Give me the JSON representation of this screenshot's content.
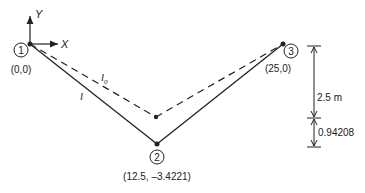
{
  "axes": {
    "x_label": "X",
    "y_label": "Y"
  },
  "nodes": [
    {
      "id": "1",
      "coord_label": "(0,0)"
    },
    {
      "id": "2",
      "coord_label": "(12.5, –3.4221)"
    },
    {
      "id": "3",
      "coord_label": "(25,0)"
    }
  ],
  "members": {
    "deformed_label": "l",
    "undeformed_label": "l",
    "undeformed_subscript": "0"
  },
  "dimensions": {
    "upper": "2.5 m",
    "lower": "0.94208"
  },
  "colors": {
    "line": "#222222",
    "background": "#ffffff"
  }
}
